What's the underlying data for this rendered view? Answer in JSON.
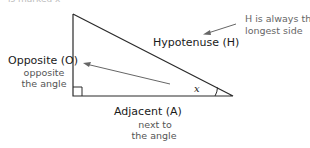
{
  "diagram": {
    "type": "right-triangle-trigonometry",
    "sides": {
      "opposite": {
        "label": "Opposite (O)",
        "description": "opposite\nthe angle",
        "desc_line1": "opposite",
        "desc_line2": "the angle"
      },
      "hypotenuse": {
        "label": "Hypotenuse (H)"
      },
      "adjacent": {
        "label": "Adjacent (A)",
        "desc_line1": "next to",
        "desc_line2": "the angle"
      }
    },
    "angle_label": "x",
    "annotation": {
      "line1": "H is always the",
      "line2": "longest side"
    },
    "truncated_header": "is marked x",
    "colors": {
      "line": "#2a2a2a",
      "arrow": "#666666",
      "note_text": "#666666",
      "sub_text": "#555555"
    }
  }
}
